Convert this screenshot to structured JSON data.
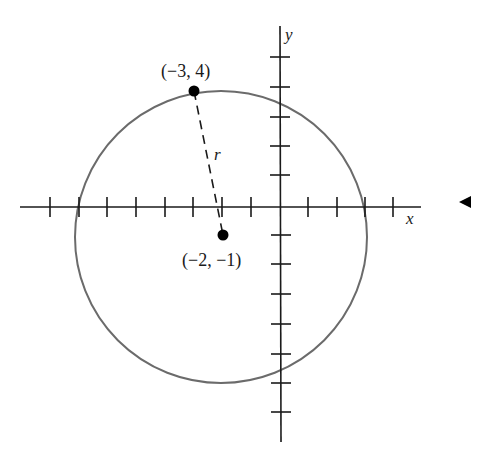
{
  "figure": {
    "type": "circle-on-coordinate-plane",
    "axes": {
      "x_label": "x",
      "y_label": "y",
      "x_ticks": [
        -8,
        -7,
        -6,
        -5,
        -4,
        -3,
        -2,
        -1,
        1,
        2,
        3,
        4
      ],
      "y_ticks": [
        -7,
        -6,
        -5,
        -4,
        -3,
        -2,
        -1,
        1,
        2,
        3,
        4,
        5
      ]
    },
    "circle": {
      "center": [
        -2,
        -1
      ],
      "point_on_circle": [
        -3,
        4
      ],
      "radius_label": "r",
      "stroke_color": "#6b6b6b"
    },
    "points": [
      {
        "label": "(−3, 4)",
        "coords": [
          -3,
          4
        ]
      },
      {
        "label": "(−2, −1)",
        "coords": [
          -2,
          -1
        ]
      }
    ],
    "side_marker": "left-pointing-triangle"
  }
}
